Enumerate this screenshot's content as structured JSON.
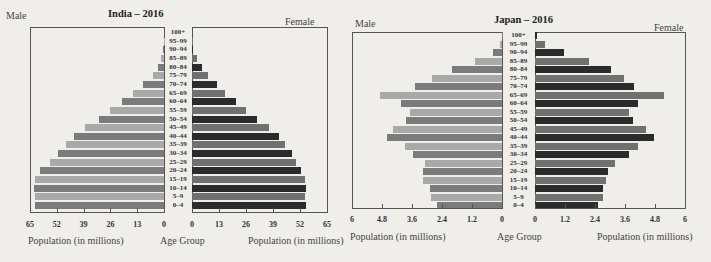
{
  "chart_data": [
    {
      "type": "bar",
      "subtype": "population-pyramid",
      "title": "India – 2016",
      "left_label": "Male",
      "right_label": "Female",
      "xlabel_left": "Population (in millions)",
      "xlabel_center": "Age Group",
      "xlabel_right": "Population (in millions)",
      "xlim": [
        0,
        65
      ],
      "ticks": [
        0,
        13,
        26,
        39,
        52,
        65
      ],
      "categories": [
        "100+",
        "95–99",
        "90–94",
        "85–89",
        "80–84",
        "75–79",
        "70–74",
        "65–69",
        "60–64",
        "55–59",
        "50–54",
        "45–49",
        "40–44",
        "35–39",
        "30–34",
        "25–29",
        "20–24",
        "15–19",
        "10–14",
        "5–9",
        "0–4"
      ],
      "series": [
        {
          "name": "Male",
          "values": [
            0,
            0.2,
            0.5,
            1.5,
            3,
            5.5,
            10,
            15,
            20.5,
            26,
            31.5,
            38.5,
            43.5,
            47.5,
            51.5,
            55.5,
            60,
            62.5,
            63,
            62.5,
            62.5
          ]
        },
        {
          "name": "Female",
          "values": [
            0,
            0.2,
            0.6,
            2.4,
            5,
            7.5,
            12,
            16,
            21,
            26,
            31.5,
            37,
            42,
            45,
            48,
            50,
            52.5,
            54.5,
            55,
            54.5,
            55
          ]
        }
      ],
      "grid": false
    },
    {
      "type": "bar",
      "subtype": "population-pyramid",
      "title": "Japan – 2016",
      "left_label": "Male",
      "right_label": "Female",
      "xlabel_left": "Population (in millions)",
      "xlabel_center": "Age Group",
      "xlabel_right": "Population (in millions)",
      "xlim": [
        0,
        6
      ],
      "ticks": [
        0,
        1.2,
        2.4,
        3.6,
        4.8,
        6
      ],
      "tick_labels": [
        "0",
        "1.2",
        "2.4",
        "3.6",
        "4.8",
        "6"
      ],
      "categories": [
        "100+",
        "95–99",
        "90–94",
        "85–89",
        "80–84",
        "75–79",
        "70–74",
        "65–69",
        "60–64",
        "55–59",
        "50–54",
        "45–49",
        "40–44",
        "35–39",
        "30–34",
        "25–29",
        "20–24",
        "15–19",
        "10–14",
        "5–9",
        "0–4"
      ],
      "series": [
        {
          "name": "Male",
          "values": [
            0.02,
            0.1,
            0.35,
            1.1,
            2.0,
            2.8,
            3.5,
            4.9,
            4.05,
            3.7,
            3.85,
            4.35,
            4.6,
            3.9,
            3.55,
            3.1,
            3.15,
            3.15,
            2.9,
            2.85,
            2.6
          ]
        },
        {
          "name": "Female",
          "values": [
            0.06,
            0.4,
            1.15,
            2.15,
            3.05,
            3.55,
            3.95,
            5.15,
            4.1,
            3.75,
            3.9,
            4.45,
            4.75,
            4.1,
            3.75,
            3.2,
            2.9,
            2.85,
            2.7,
            2.7,
            2.5
          ]
        }
      ],
      "grid": false
    }
  ],
  "colors": {
    "background": "#efeeea",
    "male_dark": "#7b7b7b",
    "male_light": "#a9a9a9",
    "female_dark": "#2b2b2b",
    "female_light": "#707070",
    "axis": "#555555"
  }
}
